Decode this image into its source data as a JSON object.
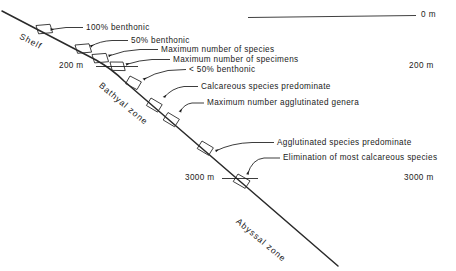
{
  "figure": {
    "type": "schematic-cross-section"
  },
  "zones": [
    {
      "name": "shelf",
      "label": "Shelf"
    },
    {
      "name": "bathyal",
      "label": "Bathyal zone"
    },
    {
      "name": "abyssal",
      "label": "Abyssal zone"
    }
  ],
  "depth_scale": {
    "sea_level": "0 m",
    "marks_right": [
      "200 m",
      "3000 m"
    ],
    "marks_on_profile": [
      "200 m",
      "3000 m"
    ]
  },
  "annotations": [
    {
      "id": "a1",
      "text": "100% benthonic"
    },
    {
      "id": "a2",
      "text": "50% benthonic"
    },
    {
      "id": "a3",
      "text": "Maximum number of species"
    },
    {
      "id": "a4",
      "text": "Maximum number of specimens"
    },
    {
      "id": "a5",
      "text": "< 50% benthonic"
    },
    {
      "id": "a6",
      "text": "Calcareous species predominate"
    },
    {
      "id": "a7",
      "text": "Maximum number agglutinated genera"
    },
    {
      "id": "a8",
      "text": "Agglutinated species predominate"
    },
    {
      "id": "a9",
      "text": "Elimination of most calcareous species"
    }
  ],
  "colors": {
    "ink": "#1a1a1a",
    "background": "#ffffff",
    "line": "#222222"
  }
}
